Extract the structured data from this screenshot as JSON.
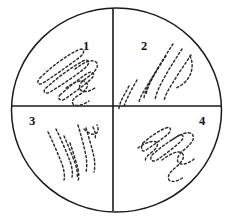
{
  "figure": {
    "name": "four-quadrant-streak-plate",
    "background_color": "#ffffff",
    "line_color": "#1a1a1a",
    "streak_color": "#2b2b2b",
    "plate": {
      "center_x": 116.5,
      "center_y": 110,
      "radius_x": 105,
      "radius_y": 102
    },
    "dividers": {
      "horizontal_y": 106,
      "horizontal_x1": 12,
      "horizontal_x2": 221,
      "vertical_x": 113,
      "vertical_y1": 9,
      "vertical_y2": 211
    },
    "quadrants": [
      {
        "label": "1",
        "label_x": 86,
        "label_y": 47,
        "position": "upper-left",
        "streak_style": "elongated dashed loops angled up-right"
      },
      {
        "label": "2",
        "label_x": 144,
        "label_y": 47,
        "position": "upper-right",
        "streak_style": "parallel dashed strokes angled down-left"
      },
      {
        "label": "3",
        "label_x": 32,
        "label_y": 122,
        "position": "lower-left",
        "streak_style": "near-vertical dashed zigzag strokes"
      },
      {
        "label": "4",
        "label_x": 202,
        "label_y": 122,
        "position": "lower-right",
        "streak_style": "elongated dashed loops angled up-right"
      }
    ],
    "streak_paths": {
      "q1": [
        "M 40 78 C 52 66, 66 56, 78 50 C 84 47, 86 52, 80 57 C 68 66, 54 76, 43 83 C 38 86, 36 82, 40 78 Z",
        "M 46 88 C 58 77, 72 67, 83 61 C 89 58, 91 63, 85 68 C 74 77, 60 86, 50 92 C 45 95, 42 91, 46 88 Z",
        "M 60 95 C 70 86, 80 78, 88 73 C 94 70, 96 75, 90 80 C 82 87, 72 94, 65 99 C 60 102, 57 98, 60 95 Z",
        "M 75 69 C 84 62, 92 59, 96 62 C 100 66, 95 72, 88 77 C 82 81, 78 85, 80 89 C 82 93, 89 92, 95 88",
        "M 66 88 C 74 82, 82 79, 86 82 C 90 86, 85 91, 79 95 C 74 98, 71 101, 73 104 C 76 107, 83 105, 89 101"
      ],
      "q2": [
        "M 173 44 C 167 53, 160 64, 154 75 C 150 82, 147 89, 146 95",
        "M 182 49 C 176 58, 169 69, 163 80 C 159 87, 156 94, 155 100",
        "M 191 55 C 185 64, 178 74, 172 84 C 168 90, 165 96, 164 101",
        "M 166 56 C 160 65, 154 75, 149 84 C 146 90, 144 95, 144 99",
        "M 158 68 C 153 76, 148 84, 144 91 C 141 96, 139 100, 139 103",
        "M 137 80 C 133 87, 129 94, 127 99 C 125 103, 124 106, 124 108",
        "M 129 86 C 126 92, 123 97, 121 101 C 120 104, 119 107, 119 109",
        "M 190 56 C 193 62, 193 70, 189 77 C 186 82, 181 86, 176 88"
      ],
      "q3": [
        "M 48 132 C 53 142, 58 154, 62 164 C 64 170, 65 176, 64 180",
        "M 56 129 C 61 139, 66 151, 70 161 C 72 167, 73 173, 72 177",
        "M 64 136 C 68 145, 72 155, 75 163 C 77 169, 78 174, 77 178",
        "M 78 125 C 81 135, 84 146, 86 156 C 87 162, 87 168, 86 172",
        "M 86 128 C 89 138, 92 148, 94 157 C 95 163, 95 168, 94 172",
        "M 70 143 C 73 152, 76 161, 78 169 C 79 174, 79 178, 78 181",
        "M 84 129 C 88 133, 92 135, 95 134 C 98 133, 99 129, 97 125",
        "M 93 127 C 95 131, 96 135, 95 139"
      ],
      "q4": [
        "M 143 143 C 151 136, 160 130, 166 128 C 171 126, 172 130, 168 134 C 161 140, 152 146, 146 150 C 142 153, 140 149, 143 143 Z",
        "M 152 155 C 161 147, 171 140, 178 136 C 183 133, 185 137, 181 141 C 174 148, 164 155, 157 160 C 152 163, 149 159, 152 155 Z",
        "M 172 140 C 180 134, 188 131, 192 134 C 196 138, 191 144, 185 149 C 180 153, 176 158, 178 162 C 181 166, 188 164, 194 159",
        "M 162 160 C 170 154, 178 150, 182 153 C 186 157, 181 163, 175 168 C 170 172, 167 176, 169 180 C 172 183, 178 181, 184 177",
        "M 138 148 C 145 143, 152 140, 156 142 C 159 144, 157 148, 152 152 C 147 156, 144 159, 146 162"
      ]
    }
  }
}
